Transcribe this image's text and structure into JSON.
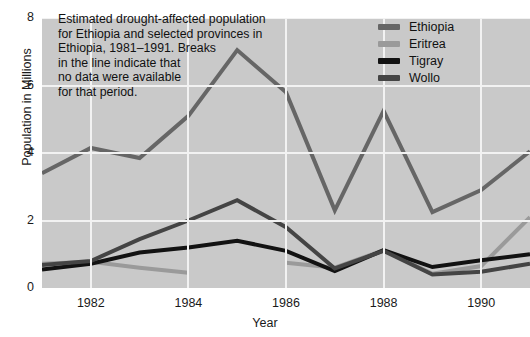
{
  "chart_data": {
    "type": "line",
    "title": "",
    "annotation": "Estimated drought-affected population\nfor Ethiopia and selected provinces in\nEthiopia, 1981–1991. Breaks\nin the line indicate that\nno data were available\nfor that period.",
    "xlabel": "Year",
    "ylabel": "Population in Millions",
    "x": [
      1981,
      1982,
      1983,
      1984,
      1985,
      1986,
      1987,
      1988,
      1989,
      1990,
      1991
    ],
    "xlim": [
      1981,
      1991
    ],
    "ylim": [
      0,
      8
    ],
    "xticks": [
      "1982",
      "1984",
      "1986",
      "1988",
      "1990"
    ],
    "xtick_values": [
      1982,
      1984,
      1986,
      1988,
      1990
    ],
    "yticks": [
      "0",
      "2",
      "4",
      "6",
      "8"
    ],
    "ytick_values": [
      0,
      2,
      4,
      6,
      8
    ],
    "grid": true,
    "legend_position": "top-right",
    "plot_background": "#c9c9c9",
    "grid_color": "#f2f2f2",
    "series": [
      {
        "name": "Ethiopia",
        "color": "#666666",
        "values": [
          3.4,
          4.15,
          3.85,
          5.1,
          7.05,
          5.8,
          2.3,
          5.25,
          2.25,
          2.9,
          4.05
        ]
      },
      {
        "name": "Eritrea",
        "color": "#9a9a9a",
        "values": [
          0.72,
          0.78,
          0.6,
          0.45,
          null,
          0.75,
          0.6,
          1.12,
          0.42,
          0.65,
          2.1
        ]
      },
      {
        "name": "Tigray",
        "color": "#121212",
        "values": [
          0.55,
          0.72,
          1.05,
          1.2,
          1.4,
          1.1,
          0.5,
          1.12,
          0.62,
          0.82,
          1.0
        ]
      },
      {
        "name": "Wollo",
        "color": "#444444",
        "values": [
          0.68,
          0.8,
          1.45,
          2.0,
          2.6,
          1.8,
          0.58,
          1.1,
          0.4,
          0.48,
          0.72
        ]
      }
    ]
  }
}
